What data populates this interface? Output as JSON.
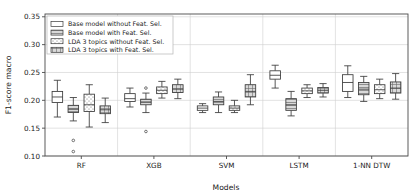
{
  "chart_data": {
    "type": "box",
    "title": "",
    "xlabel": "Models",
    "ylabel": "F1-score macro",
    "categories": [
      "RF",
      "XGB",
      "SVM",
      "LSTM",
      "1-NN DTW"
    ],
    "ylim": [
      0.1,
      0.355
    ],
    "yticks": [
      0.1,
      0.15,
      0.2,
      0.25,
      0.3,
      0.35
    ],
    "ytick_labels": [
      "0.10",
      "0.15",
      "0.20",
      "0.25",
      "0.30",
      "0.35"
    ],
    "grid": true,
    "legend_position": "upper left",
    "series": [
      {
        "name": "Base model without Feat. Sel.",
        "pattern": "plain",
        "fill": "#ffffff",
        "boxes": [
          {
            "category": "RF",
            "whisker_low": 0.17,
            "q1": 0.196,
            "median": 0.206,
            "q3": 0.216,
            "whisker_high": 0.236,
            "outliers": []
          },
          {
            "category": "XGB",
            "whisker_low": 0.188,
            "q1": 0.198,
            "median": 0.203,
            "q3": 0.212,
            "whisker_high": 0.222,
            "outliers": []
          },
          {
            "category": "SVM",
            "whisker_low": 0.178,
            "q1": 0.182,
            "median": 0.186,
            "q3": 0.19,
            "whisker_high": 0.194,
            "outliers": []
          },
          {
            "category": "LSTM",
            "whisker_low": 0.222,
            "q1": 0.238,
            "median": 0.245,
            "q3": 0.253,
            "whisker_high": 0.263,
            "outliers": []
          },
          {
            "category": "1-NN DTW",
            "whisker_low": 0.205,
            "q1": 0.216,
            "median": 0.232,
            "q3": 0.246,
            "whisker_high": 0.262,
            "outliers": []
          }
        ]
      },
      {
        "name": "Base model with Feat. Sel.",
        "pattern": "horizontal-lines",
        "fill": "#d9d9d9",
        "boxes": [
          {
            "category": "RF",
            "whisker_low": 0.163,
            "q1": 0.178,
            "median": 0.184,
            "q3": 0.191,
            "whisker_high": 0.205,
            "outliers": [
              0.128,
              0.108
            ]
          },
          {
            "category": "XGB",
            "whisker_low": 0.178,
            "q1": 0.192,
            "median": 0.197,
            "q3": 0.202,
            "whisker_high": 0.213,
            "outliers": [
              0.222,
              0.144
            ]
          },
          {
            "category": "SVM",
            "whisker_low": 0.178,
            "q1": 0.192,
            "median": 0.198,
            "q3": 0.206,
            "whisker_high": 0.215,
            "outliers": []
          },
          {
            "category": "LSTM",
            "whisker_low": 0.172,
            "q1": 0.182,
            "median": 0.192,
            "q3": 0.203,
            "whisker_high": 0.216,
            "outliers": []
          },
          {
            "category": "1-NN DTW",
            "whisker_low": 0.198,
            "q1": 0.21,
            "median": 0.22,
            "q3": 0.232,
            "whisker_high": 0.243,
            "outliers": []
          }
        ]
      },
      {
        "name": "LDA 3 topics without Feat. Sel.",
        "pattern": "dots",
        "fill": "#ffffff",
        "boxes": [
          {
            "category": "RF",
            "whisker_low": 0.152,
            "q1": 0.18,
            "median": 0.192,
            "q3": 0.211,
            "whisker_high": 0.228,
            "outliers": []
          },
          {
            "category": "XGB",
            "whisker_low": 0.204,
            "q1": 0.212,
            "median": 0.218,
            "q3": 0.224,
            "whisker_high": 0.234,
            "outliers": []
          },
          {
            "category": "SVM",
            "whisker_low": 0.178,
            "q1": 0.182,
            "median": 0.186,
            "q3": 0.19,
            "whisker_high": 0.2,
            "outliers": []
          },
          {
            "category": "LSTM",
            "whisker_low": 0.205,
            "q1": 0.212,
            "median": 0.217,
            "q3": 0.222,
            "whisker_high": 0.228,
            "outliers": []
          },
          {
            "category": "1-NN DTW",
            "whisker_low": 0.203,
            "q1": 0.212,
            "median": 0.219,
            "q3": 0.228,
            "whisker_high": 0.238,
            "outliers": []
          }
        ]
      },
      {
        "name": "LDA 3 topics with Feat. Sel.",
        "pattern": "grid",
        "fill": "#d9d9d9",
        "boxes": [
          {
            "category": "RF",
            "whisker_low": 0.16,
            "q1": 0.176,
            "median": 0.183,
            "q3": 0.19,
            "whisker_high": 0.204,
            "outliers": []
          },
          {
            "category": "XGB",
            "whisker_low": 0.203,
            "q1": 0.214,
            "median": 0.22,
            "q3": 0.228,
            "whisker_high": 0.238,
            "outliers": []
          },
          {
            "category": "SVM",
            "whisker_low": 0.192,
            "q1": 0.206,
            "median": 0.216,
            "q3": 0.228,
            "whisker_high": 0.246,
            "outliers": []
          },
          {
            "category": "LSTM",
            "whisker_low": 0.206,
            "q1": 0.213,
            "median": 0.218,
            "q3": 0.223,
            "whisker_high": 0.23,
            "outliers": []
          },
          {
            "category": "1-NN DTW",
            "whisker_low": 0.202,
            "q1": 0.213,
            "median": 0.222,
            "q3": 0.233,
            "whisker_high": 0.248,
            "outliers": []
          }
        ]
      }
    ],
    "colors": {
      "line": "#3a3a3a",
      "grid": "#cfcfcf",
      "axis": "#4a4a4a",
      "text": "#1a1a1a",
      "fill_light": "#ffffff",
      "fill_gray": "#d9d9d9"
    }
  },
  "legend": {
    "items": [
      {
        "label": "Base model without Feat. Sel."
      },
      {
        "label": "Base model with Feat. Sel."
      },
      {
        "label": "LDA 3 topics without Feat. Sel."
      },
      {
        "label": "LDA 3 topics with Feat. Sel."
      }
    ]
  }
}
